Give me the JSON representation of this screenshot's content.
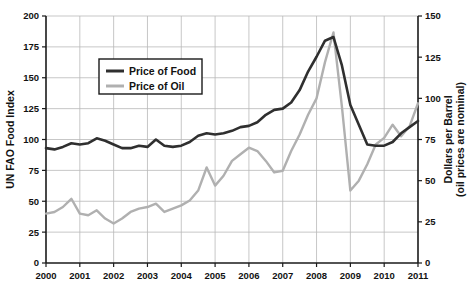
{
  "chart_data": {
    "type": "line",
    "title": "",
    "xlabel": "",
    "ylabel": "UN FAO Food Index",
    "y2label_line1": "Dollars per Barrel",
    "y2label_line2": "(oil prices are nominal)",
    "grid": true,
    "legend_position": "top-left-inside",
    "xlim": [
      2000,
      2011
    ],
    "ylim": [
      0,
      200
    ],
    "y2lim": [
      0,
      150
    ],
    "x_ticks": [
      "2000",
      "2001",
      "2002",
      "2003",
      "2004",
      "2005",
      "2006",
      "2007",
      "2008",
      "2009",
      "2010",
      "2011"
    ],
    "y_ticks": [
      "0",
      "25",
      "50",
      "75",
      "100",
      "125",
      "150",
      "175",
      "200"
    ],
    "y2_ticks": [
      "0",
      "25",
      "50",
      "75",
      "100",
      "125",
      "150"
    ],
    "series": [
      {
        "name": "Price of Food",
        "color": "#2f2f2f",
        "axis": "left",
        "units": "UN FAO Food Index",
        "x": [
          2000.0,
          2000.25,
          2000.5,
          2000.75,
          2001.0,
          2001.25,
          2001.5,
          2001.75,
          2002.0,
          2002.25,
          2002.5,
          2002.75,
          2003.0,
          2003.25,
          2003.5,
          2003.75,
          2004.0,
          2004.25,
          2004.5,
          2004.75,
          2005.0,
          2005.25,
          2005.5,
          2005.75,
          2006.0,
          2006.25,
          2006.5,
          2006.75,
          2007.0,
          2007.25,
          2007.5,
          2007.75,
          2008.0,
          2008.25,
          2008.5,
          2008.75,
          2009.0,
          2009.25,
          2009.5,
          2009.75,
          2010.0,
          2010.25,
          2010.5,
          2010.75,
          2011.0
        ],
        "values": [
          93,
          92,
          94,
          97,
          96,
          97,
          101,
          99,
          96,
          93,
          93,
          95,
          94,
          100,
          95,
          94,
          95,
          98,
          103,
          105,
          104,
          105,
          107,
          110,
          111,
          114,
          120,
          124,
          125,
          130,
          140,
          155,
          167,
          180,
          183,
          160,
          128,
          112,
          96,
          95,
          95,
          98,
          105,
          110,
          115
        ]
      },
      {
        "name": "Price of Oil",
        "color": "#b0b0b0",
        "axis": "right",
        "units": "Dollars per Barrel",
        "x": [
          2000.0,
          2000.25,
          2000.5,
          2000.75,
          2001.0,
          2001.25,
          2001.5,
          2001.75,
          2002.0,
          2002.25,
          2002.5,
          2002.75,
          2003.0,
          2003.25,
          2003.5,
          2003.75,
          2004.0,
          2004.25,
          2004.5,
          2004.75,
          2005.0,
          2005.25,
          2005.5,
          2005.75,
          2006.0,
          2006.25,
          2006.5,
          2006.75,
          2007.0,
          2007.25,
          2007.5,
          2007.75,
          2008.0,
          2008.25,
          2008.5,
          2008.75,
          2009.0,
          2009.25,
          2009.5,
          2009.75,
          2010.0,
          2010.25,
          2010.5,
          2010.75,
          2011.0
        ],
        "values": [
          30,
          31,
          34,
          39,
          30,
          29,
          32,
          27,
          24,
          27,
          31,
          33,
          34,
          36,
          31,
          33,
          35,
          38,
          44,
          58,
          47,
          53,
          62,
          66,
          70,
          68,
          62,
          55,
          56,
          68,
          78,
          90,
          100,
          122,
          140,
          95,
          44,
          50,
          60,
          72,
          76,
          84,
          77,
          83,
          97
        ]
      }
    ],
    "legend": [
      {
        "label": "Price of Food",
        "color": "#2f2f2f"
      },
      {
        "label": "Price of Oil",
        "color": "#b0b0b0"
      }
    ]
  }
}
